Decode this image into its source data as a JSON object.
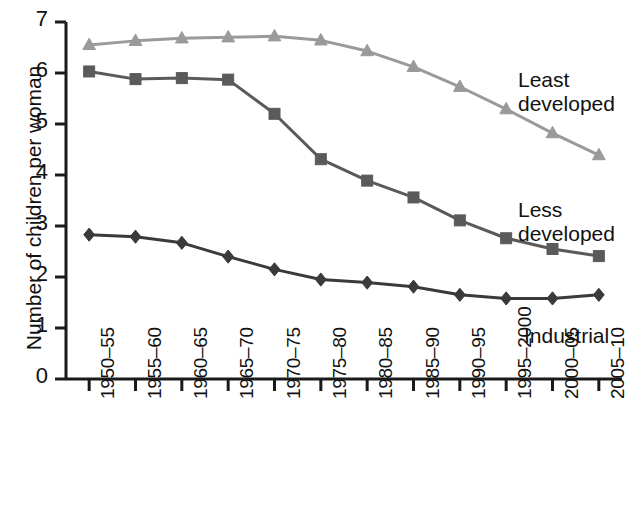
{
  "chart_data": {
    "type": "line",
    "title": "",
    "subtitle": "",
    "xlabel": "",
    "ylabel": "Number of children per woman",
    "ylim": [
      0,
      7
    ],
    "yticks": [
      0,
      1,
      2,
      3,
      4,
      5,
      6,
      7
    ],
    "ytick_labels": [
      "0",
      "1",
      "2",
      "3",
      "4",
      "5",
      "6",
      "7"
    ],
    "grid": false,
    "legend_position": "inline-annotations",
    "categories": [
      "1950–55",
      "1955–60",
      "1960–65",
      "1965–70",
      "1970–75",
      "1975–80",
      "1980–85",
      "1985–90",
      "1990–95",
      "1995–2000",
      "2000–05",
      "2005–10"
    ],
    "series": [
      {
        "name": "Least developed",
        "marker": "triangle",
        "color": "#9a9a9a",
        "values": [
          6.55,
          6.63,
          6.68,
          6.7,
          6.72,
          6.64,
          6.43,
          6.12,
          5.73,
          5.29,
          4.82,
          4.39
        ]
      },
      {
        "name": "Less developed",
        "marker": "square",
        "color": "#5a5a5a",
        "values": [
          6.03,
          5.88,
          5.9,
          5.87,
          5.2,
          4.31,
          3.89,
          3.56,
          3.11,
          2.76,
          2.55,
          2.41
        ]
      },
      {
        "name": "Industrial",
        "marker": "diamond",
        "color": "#3a3a3a",
        "values": [
          2.83,
          2.79,
          2.67,
          2.4,
          2.15,
          1.95,
          1.89,
          1.81,
          1.65,
          1.58,
          1.58,
          1.65
        ]
      }
    ],
    "annotations": [
      {
        "text": "Least\ndeveloped",
        "series": "Least developed"
      },
      {
        "text": "Less\ndeveloped",
        "series": "Less developed"
      },
      {
        "text": "Industrial",
        "series": "Industrial"
      }
    ]
  },
  "colors": {
    "axis": "#1a1a1a",
    "text": "#111111",
    "background": "#ffffff",
    "least_developed": "#9a9a9a",
    "less_developed": "#5a5a5a",
    "industrial": "#3a3a3a"
  }
}
